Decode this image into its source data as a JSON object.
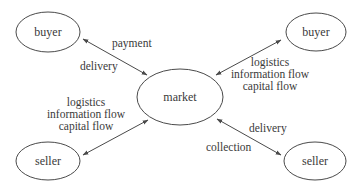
{
  "diagram": {
    "type": "hub-and-spoke",
    "colors": {
      "stroke": "#4a4a4a",
      "text": "#3a3a3a",
      "background": "#ffffff"
    },
    "nodes": {
      "buyer_left": {
        "label": "buyer",
        "cx": 48,
        "cy": 32,
        "rx": 32,
        "ry": 20
      },
      "buyer_right": {
        "label": "buyer",
        "cx": 316,
        "cy": 32,
        "rx": 30,
        "ry": 19
      },
      "market": {
        "label": "market",
        "cx": 180,
        "cy": 97,
        "rx": 43,
        "ry": 28
      },
      "seller_left": {
        "label": "seller",
        "cx": 48,
        "cy": 161,
        "rx": 32,
        "ry": 19
      },
      "seller_right": {
        "label": "seller",
        "cx": 315,
        "cy": 161,
        "rx": 31,
        "ry": 19
      }
    },
    "edges": {
      "top_left": {
        "from": "buyer_left",
        "to": "market",
        "direction": "bidirectional",
        "labels": [
          "payment",
          "delivery"
        ]
      },
      "top_right": {
        "from": "buyer_right",
        "to": "market",
        "direction": "bidirectional",
        "labels": [
          "logistics",
          "information flow",
          "capital flow"
        ]
      },
      "bottom_left": {
        "from": "seller_left",
        "to": "market",
        "direction": "bidirectional",
        "labels": [
          "logistics",
          "information flow",
          "capital flow"
        ]
      },
      "bottom_right": {
        "from": "seller_right",
        "to": "market",
        "direction": "bidirectional",
        "labels": [
          "delivery",
          "collection"
        ]
      }
    }
  }
}
